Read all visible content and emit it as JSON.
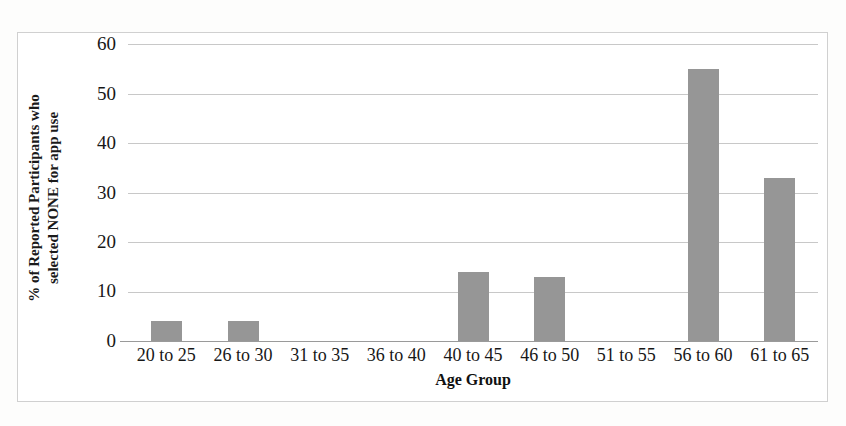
{
  "chart_data": {
    "type": "bar",
    "title": "",
    "subtitle": "",
    "xlabel": "Age Group",
    "ylabel": "% of Reported Participants who selected NONE for app use",
    "ylabel_lines": [
      "% of Reported Participants who",
      "selected NONE for app use"
    ],
    "categories": [
      "20 to 25",
      "26 to 30",
      "31 to 35",
      "36 to 40",
      "40 to 45",
      "46 to 50",
      "51 to 55",
      "56 to 60",
      "61 to 65"
    ],
    "values": [
      4,
      4,
      0,
      0,
      14,
      13,
      0,
      55,
      33
    ],
    "ylim": [
      0,
      60
    ],
    "ytick_labels": [
      "60",
      "50",
      "40",
      "30",
      "20",
      "10",
      "0"
    ],
    "ytick_values": [
      60,
      50,
      40,
      30,
      20,
      10,
      0
    ],
    "ytick_step": 10,
    "grid": "horizontal",
    "legend": "none",
    "bar_color": "#969696",
    "gridline_color": "#c8c8c8",
    "axis_color": "#9a9a9a",
    "background_color": "#ffffff"
  }
}
